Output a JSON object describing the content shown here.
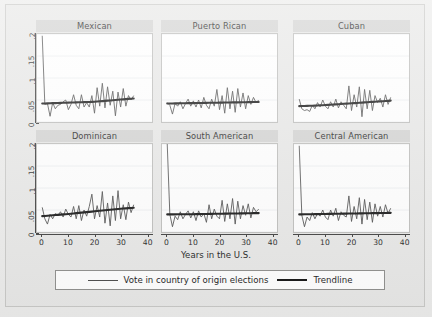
{
  "chart_data": {
    "type": "line",
    "title": "",
    "xlabel": "Years in the U.S.",
    "ylabel": "",
    "xlim": [
      -2,
      42
    ],
    "ylim": [
      0,
      0.2
    ],
    "grid": true,
    "grid_axis": "y",
    "legend_position": "bottom",
    "x_ticks": [
      "0",
      "10",
      "20",
      "30",
      "40"
    ],
    "x_tick_values": [
      0,
      10,
      20,
      30,
      40
    ],
    "y_ticks": [
      "0",
      ".05",
      ".1",
      ".15",
      ".2"
    ],
    "y_tick_values": [
      0,
      0.05,
      0.1,
      0.15,
      0.2
    ],
    "series_names": [
      "Vote in country of origin elections",
      "Trendline"
    ],
    "panel_titles": [
      "Mexican",
      "Puerto Rican",
      "Cuban",
      "Dominican",
      "South American",
      "Central American"
    ],
    "panels": [
      {
        "title": "Mexican",
        "x": [
          0,
          1,
          2,
          3,
          4,
          5,
          6,
          7,
          8,
          9,
          10,
          11,
          12,
          13,
          14,
          15,
          16,
          17,
          18,
          19,
          20,
          21,
          22,
          23,
          24,
          25,
          26,
          27,
          28,
          29,
          30,
          31,
          32,
          33,
          34,
          35
        ],
        "raw": [
          0.196,
          0.04,
          0.042,
          0.013,
          0.044,
          0.03,
          0.038,
          0.04,
          0.046,
          0.05,
          0.028,
          0.04,
          0.062,
          0.038,
          0.03,
          0.062,
          0.034,
          0.044,
          0.034,
          0.06,
          0.02,
          0.078,
          0.036,
          0.088,
          0.032,
          0.08,
          0.038,
          0.07,
          0.014,
          0.068,
          0.034,
          0.076,
          0.036,
          0.06,
          0.05,
          0.06
        ],
        "trend": [
          0.042,
          0.0422,
          0.0424,
          0.0426,
          0.0428,
          0.043,
          0.0432,
          0.0434,
          0.0436,
          0.0438,
          0.044,
          0.0442,
          0.0444,
          0.0446,
          0.0448,
          0.045,
          0.0452,
          0.0454,
          0.0456,
          0.0458,
          0.046,
          0.0465,
          0.047,
          0.0475,
          0.048,
          0.0485,
          0.049,
          0.0495,
          0.05,
          0.0505,
          0.051,
          0.0515,
          0.052,
          0.0525,
          0.053,
          0.0535
        ]
      },
      {
        "title": "Puerto Rican",
        "x": [
          0,
          1,
          2,
          3,
          4,
          5,
          6,
          7,
          8,
          9,
          10,
          11,
          12,
          13,
          14,
          15,
          16,
          17,
          18,
          19,
          20,
          21,
          22,
          23,
          24,
          25,
          26,
          27,
          28,
          29,
          30,
          31,
          32,
          33,
          34,
          35
        ],
        "raw": [
          0.044,
          0.038,
          0.018,
          0.042,
          0.036,
          0.046,
          0.03,
          0.042,
          0.052,
          0.036,
          0.048,
          0.034,
          0.05,
          0.032,
          0.056,
          0.038,
          0.03,
          0.052,
          0.036,
          0.074,
          0.028,
          0.06,
          0.02,
          0.078,
          0.03,
          0.07,
          0.022,
          0.076,
          0.034,
          0.066,
          0.03,
          0.06,
          0.04,
          0.056,
          0.044,
          0.05
        ],
        "trend": [
          0.042,
          0.0421,
          0.0422,
          0.0423,
          0.0424,
          0.0425,
          0.0426,
          0.0427,
          0.0428,
          0.0429,
          0.043,
          0.0431,
          0.0432,
          0.0433,
          0.0434,
          0.0435,
          0.0436,
          0.0437,
          0.0438,
          0.0439,
          0.044,
          0.0441,
          0.0442,
          0.0443,
          0.0444,
          0.0445,
          0.0446,
          0.0447,
          0.0448,
          0.0449,
          0.045,
          0.0451,
          0.0452,
          0.0453,
          0.0454,
          0.0455
        ]
      },
      {
        "title": "Cuban",
        "x": [
          0,
          1,
          2,
          3,
          4,
          5,
          6,
          7,
          8,
          9,
          10,
          11,
          12,
          13,
          14,
          15,
          16,
          17,
          18,
          19,
          20,
          21,
          22,
          23,
          24,
          25,
          26,
          27,
          28,
          29,
          30,
          31,
          32,
          33,
          34,
          35
        ],
        "raw": [
          0.052,
          0.03,
          0.026,
          0.028,
          0.024,
          0.038,
          0.03,
          0.044,
          0.034,
          0.05,
          0.036,
          0.03,
          0.046,
          0.034,
          0.052,
          0.032,
          0.046,
          0.038,
          0.03,
          0.082,
          0.026,
          0.062,
          0.034,
          0.08,
          0.012,
          0.074,
          0.03,
          0.072,
          0.026,
          0.06,
          0.044,
          0.054,
          0.034,
          0.062,
          0.04,
          0.056
        ],
        "trend": [
          0.036,
          0.0362,
          0.0364,
          0.0366,
          0.0368,
          0.037,
          0.0373,
          0.0376,
          0.0379,
          0.0382,
          0.0385,
          0.0389,
          0.0393,
          0.0397,
          0.0401,
          0.0405,
          0.0409,
          0.0413,
          0.0417,
          0.0421,
          0.0425,
          0.0429,
          0.0433,
          0.0437,
          0.0441,
          0.0445,
          0.0449,
          0.0453,
          0.0457,
          0.0461,
          0.0465,
          0.0469,
          0.0473,
          0.0477,
          0.0481,
          0.0485
        ]
      },
      {
        "title": "Dominican",
        "x": [
          0,
          1,
          2,
          3,
          4,
          5,
          6,
          7,
          8,
          9,
          10,
          11,
          12,
          13,
          14,
          15,
          16,
          17,
          18,
          19,
          20,
          21,
          22,
          23,
          24,
          25,
          26,
          27,
          28,
          29,
          30,
          31,
          32,
          33,
          34,
          35
        ],
        "raw": [
          0.056,
          0.03,
          0.018,
          0.04,
          0.03,
          0.042,
          0.038,
          0.046,
          0.034,
          0.052,
          0.04,
          0.034,
          0.058,
          0.03,
          0.06,
          0.026,
          0.05,
          0.036,
          0.058,
          0.086,
          0.03,
          0.06,
          0.034,
          0.092,
          0.02,
          0.066,
          0.014,
          0.082,
          0.026,
          0.094,
          0.03,
          0.062,
          0.028,
          0.068,
          0.044,
          0.062
        ],
        "trend": [
          0.036,
          0.0365,
          0.037,
          0.0375,
          0.038,
          0.0385,
          0.039,
          0.0395,
          0.04,
          0.0405,
          0.041,
          0.0416,
          0.0422,
          0.0428,
          0.0434,
          0.044,
          0.0446,
          0.0452,
          0.0458,
          0.0464,
          0.047,
          0.0476,
          0.0482,
          0.0488,
          0.0494,
          0.05,
          0.0506,
          0.0512,
          0.0518,
          0.0524,
          0.053,
          0.0534,
          0.0538,
          0.0542,
          0.0546,
          0.055
        ]
      },
      {
        "title": "South American",
        "x": [
          0,
          1,
          2,
          3,
          4,
          5,
          6,
          7,
          8,
          9,
          10,
          11,
          12,
          13,
          14,
          15,
          16,
          17,
          18,
          19,
          20,
          21,
          22,
          23,
          24,
          25,
          26,
          27,
          28,
          29,
          30,
          31,
          32,
          33,
          34,
          35
        ],
        "raw": [
          0.2,
          0.04,
          0.012,
          0.036,
          0.028,
          0.046,
          0.03,
          0.04,
          0.048,
          0.032,
          0.046,
          0.026,
          0.048,
          0.034,
          0.042,
          0.022,
          0.062,
          0.03,
          0.052,
          0.036,
          0.03,
          0.072,
          0.024,
          0.064,
          0.03,
          0.076,
          0.018,
          0.07,
          0.03,
          0.06,
          0.038,
          0.064,
          0.032,
          0.056,
          0.046,
          0.052
        ],
        "trend": [
          0.04,
          0.04,
          0.0401,
          0.0401,
          0.0402,
          0.0402,
          0.0403,
          0.0403,
          0.0404,
          0.0404,
          0.0405,
          0.0406,
          0.0407,
          0.0408,
          0.0409,
          0.041,
          0.0411,
          0.0412,
          0.0413,
          0.0414,
          0.0415,
          0.0416,
          0.0417,
          0.0418,
          0.0419,
          0.042,
          0.0421,
          0.0422,
          0.0423,
          0.0424,
          0.0425,
          0.0426,
          0.0427,
          0.0428,
          0.0429,
          0.043
        ]
      },
      {
        "title": "Central American",
        "x": [
          0,
          1,
          2,
          3,
          4,
          5,
          6,
          7,
          8,
          9,
          10,
          11,
          12,
          13,
          14,
          15,
          16,
          17,
          18,
          19,
          20,
          21,
          22,
          23,
          24,
          25,
          26,
          27,
          28,
          29,
          30,
          31,
          32,
          33,
          34,
          35
        ],
        "raw": [
          0.196,
          0.038,
          0.012,
          0.034,
          0.026,
          0.044,
          0.03,
          0.042,
          0.036,
          0.05,
          0.034,
          0.028,
          0.05,
          0.036,
          0.054,
          0.026,
          0.046,
          0.038,
          0.034,
          0.082,
          0.024,
          0.058,
          0.03,
          0.078,
          0.018,
          0.074,
          0.028,
          0.068,
          0.022,
          0.064,
          0.036,
          0.058,
          0.034,
          0.062,
          0.042,
          0.054
        ],
        "trend": [
          0.04,
          0.0401,
          0.0402,
          0.0403,
          0.0404,
          0.0405,
          0.0406,
          0.0407,
          0.0408,
          0.0409,
          0.041,
          0.0411,
          0.0412,
          0.0413,
          0.0414,
          0.0415,
          0.0416,
          0.0417,
          0.0418,
          0.0419,
          0.042,
          0.0421,
          0.0422,
          0.0423,
          0.0424,
          0.0425,
          0.0426,
          0.0427,
          0.0428,
          0.0429,
          0.043,
          0.0431,
          0.0432,
          0.0433,
          0.0434,
          0.0435
        ]
      }
    ]
  },
  "axis": {
    "x_title": "Years in the U.S.",
    "x_tick_labels": [
      "0",
      "10",
      "20",
      "30",
      "40"
    ],
    "y_tick_labels": [
      "0",
      ".05",
      ".1",
      ".15",
      ".2"
    ]
  },
  "legend": {
    "entries": [
      {
        "label": "Vote in country of origin elections",
        "style": "thin"
      },
      {
        "label": "Trendline",
        "style": "thick"
      }
    ]
  },
  "colors": {
    "page_background": "#ececeb",
    "panel_title_background": "#d3d3d2",
    "plot_background": "#ffffff",
    "series_line": "#4a4a4a",
    "trend_line": "#111111",
    "axis": "#3a3a3a",
    "gridline": "#eef0f2"
  }
}
